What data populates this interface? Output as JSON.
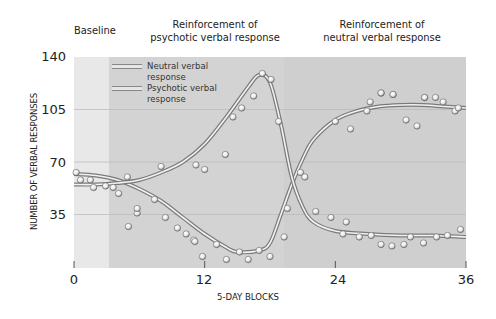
{
  "chart_data": {
    "type": "line",
    "title": "",
    "phases": [
      {
        "label": "Baseline",
        "x_start": 0,
        "x_end": 3.2,
        "color": "#e8e8e8"
      },
      {
        "label": "Reinforcement of\npsychotic verbal response",
        "x_start": 3.2,
        "x_end": 19.2,
        "color": "#d3d3d3"
      },
      {
        "label": "Reinforcement of\nneutral verbal response",
        "x_start": 19.2,
        "x_end": 36,
        "color": "#cfcfcf"
      }
    ],
    "xlabel": "5-DAY BLOCKS",
    "ylabel": "NUMBER OF VERBAL RESPONSES",
    "xlim": [
      0,
      36
    ],
    "ylim": [
      0,
      140
    ],
    "xticks": [
      0,
      12,
      24,
      36
    ],
    "yticks": [
      35,
      70,
      105,
      140
    ],
    "grid": "horizontal",
    "legend_position": "upper-left",
    "series": [
      {
        "name": "Neutral verbal response",
        "curve": [
          [
            0,
            62
          ],
          [
            2,
            61
          ],
          [
            4,
            58
          ],
          [
            6,
            52
          ],
          [
            8,
            44
          ],
          [
            10,
            33
          ],
          [
            12,
            22
          ],
          [
            14,
            13
          ],
          [
            15,
            10
          ],
          [
            17,
            11
          ],
          [
            18,
            16
          ],
          [
            19,
            35
          ],
          [
            20,
            55
          ],
          [
            21,
            72
          ],
          [
            22,
            85
          ],
          [
            24,
            98
          ],
          [
            26,
            104
          ],
          [
            28,
            107
          ],
          [
            30,
            108
          ],
          [
            32,
            108
          ],
          [
            34,
            107
          ],
          [
            36,
            106
          ]
        ],
        "points": [
          [
            0.2,
            63
          ],
          [
            0.6,
            58
          ],
          [
            1.5,
            58
          ],
          [
            1.8,
            53
          ],
          [
            2.9,
            54
          ],
          [
            3.6,
            53
          ],
          [
            4.1,
            49
          ],
          [
            5.8,
            36
          ],
          [
            7.4,
            45
          ],
          [
            5.8,
            39
          ],
          [
            5.0,
            27
          ],
          [
            8.4,
            33
          ],
          [
            9.5,
            26
          ],
          [
            10.3,
            22
          ],
          [
            11.0,
            18
          ],
          [
            11.8,
            7
          ],
          [
            11.1,
            17
          ],
          [
            13.1,
            15
          ],
          [
            14.0,
            5
          ],
          [
            15.2,
            10
          ],
          [
            16.0,
            5
          ],
          [
            17.0,
            11
          ],
          [
            18.0,
            7
          ],
          [
            19.3,
            20
          ]
        ]
      },
      {
        "name": "Psychotic verbal response",
        "curve": [
          [
            0,
            55
          ],
          [
            2,
            55
          ],
          [
            4,
            56
          ],
          [
            6,
            58
          ],
          [
            8,
            63
          ],
          [
            10,
            70
          ],
          [
            12,
            82
          ],
          [
            14,
            100
          ],
          [
            16,
            120
          ],
          [
            17,
            128
          ],
          [
            18,
            123
          ],
          [
            19,
            95
          ],
          [
            20,
            60
          ],
          [
            21,
            40
          ],
          [
            22,
            30
          ],
          [
            24,
            24
          ],
          [
            27,
            22
          ],
          [
            30,
            21
          ],
          [
            33,
            21
          ],
          [
            36,
            20
          ]
        ],
        "points": [
          [
            4.9,
            60
          ],
          [
            8.0,
            67
          ],
          [
            11.2,
            68
          ],
          [
            12.0,
            65
          ],
          [
            13.9,
            75
          ],
          [
            14.6,
            100
          ],
          [
            15.4,
            106
          ],
          [
            16.5,
            114
          ],
          [
            17.3,
            129
          ],
          [
            18.1,
            125
          ],
          [
            18.8,
            97
          ],
          [
            19.6,
            39
          ],
          [
            20.8,
            63
          ],
          [
            21.2,
            60
          ],
          [
            22.2,
            37
          ],
          [
            23.6,
            33
          ],
          [
            24.7,
            22
          ],
          [
            25.0,
            30
          ],
          [
            26.2,
            20
          ],
          [
            27.3,
            21
          ],
          [
            28.2,
            15
          ],
          [
            29.2,
            14
          ],
          [
            30.3,
            15
          ],
          [
            30.9,
            20
          ],
          [
            32.1,
            16
          ],
          [
            33.3,
            20
          ],
          [
            34.3,
            21
          ],
          [
            35.5,
            25
          ]
        ]
      },
      {
        "name": "Neutral verbal response (phase 3 points)",
        "points": [
          [
            24.0,
            97
          ],
          [
            25.4,
            92
          ],
          [
            26.9,
            104
          ],
          [
            28.2,
            116
          ],
          [
            28.2,
            116
          ],
          [
            27.2,
            110
          ],
          [
            29.3,
            115
          ],
          [
            29.3,
            115
          ],
          [
            30.5,
            98
          ],
          [
            32.2,
            113
          ],
          [
            32.2,
            113
          ],
          [
            31.5,
            94
          ],
          [
            33.2,
            113
          ],
          [
            33.9,
            110
          ],
          [
            35.0,
            104
          ],
          [
            35.3,
            106
          ]
        ]
      }
    ]
  },
  "legend": {
    "items": [
      {
        "label_line1": "Neutral verbal",
        "label_line2": "response"
      },
      {
        "label_line1": "Psychotic verbal",
        "label_line2": "response"
      }
    ]
  },
  "phase_labels": {
    "baseline": "Baseline",
    "psychotic_line1": "Reinforcement of",
    "psychotic_line2": "psychotic verbal response",
    "neutral_line1": "Reinforcement of",
    "neutral_line2": "neutral verbal response"
  },
  "axes": {
    "y_ticks": [
      "140",
      "105",
      "70",
      "35"
    ],
    "x_ticks": [
      "0",
      "12",
      "24",
      "36"
    ],
    "xlabel": "5-DAY BLOCKS",
    "ylabel": "NUMBER OF VERBAL RESPONSES"
  }
}
